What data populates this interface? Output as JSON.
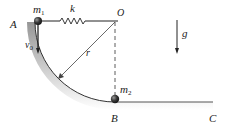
{
  "diagram": {
    "labels": {
      "A": "A",
      "B": "B",
      "C": "C",
      "O": "O",
      "m1": "m",
      "m1_sub": "1",
      "m2": "m",
      "m2_sub": "2",
      "k": "k",
      "r": "r",
      "v0": "v",
      "v0_sub": "0",
      "g": "g"
    },
    "colors": {
      "line": "#333333",
      "shadow": "#9a9a9a",
      "ball": "#3a3a3a"
    }
  }
}
